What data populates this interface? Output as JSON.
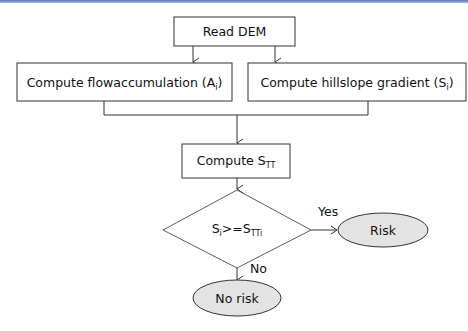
{
  "diagram": {
    "type": "flowchart",
    "nodes": {
      "read_dem": {
        "label": "Read DEM",
        "shape": "rectangle"
      },
      "flowacc": {
        "label": "Compute flowaccumulation (A",
        "sub": "i",
        "suffix": ")",
        "shape": "rectangle"
      },
      "gradient": {
        "label": "Compute hillslope gradient (S",
        "sub": "i",
        "suffix": ")",
        "shape": "rectangle"
      },
      "stt": {
        "label": "Compute S",
        "sub": "TT",
        "shape": "rectangle"
      },
      "decision": {
        "label_a": "S",
        "sub_a": "i",
        "op": ">=S",
        "sub_b": "TTi",
        "shape": "diamond"
      },
      "risk": {
        "label": "Risk",
        "shape": "ellipse"
      },
      "no_risk": {
        "label": "No risk",
        "shape": "ellipse"
      }
    },
    "edges": {
      "yes": "Yes",
      "no": "No"
    },
    "colors": {
      "stroke": "#333333",
      "ellipse_fill": "#e3e3e3",
      "top_rule": "#5b78b8"
    }
  }
}
